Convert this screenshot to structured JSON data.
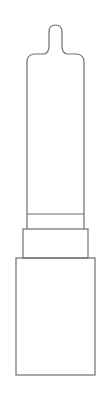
{
  "diagram": {
    "stroke_color": "#6e6e6e",
    "background_color": "#ffffff",
    "parts": [
      {
        "name": "bullet-tip"
      },
      {
        "name": "bullet-body"
      },
      {
        "name": "band"
      },
      {
        "name": "collar"
      },
      {
        "name": "base-case"
      }
    ]
  }
}
